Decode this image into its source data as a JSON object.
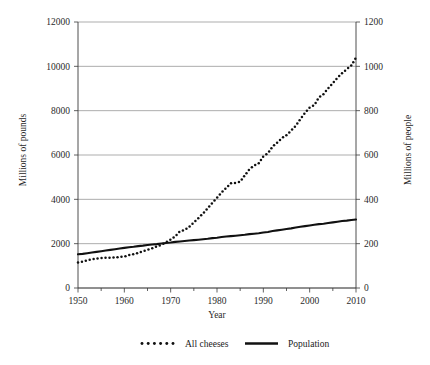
{
  "figure": {
    "background_color": "#ffffff",
    "ink_color": "#111111",
    "grid_color": "#8a8a8a"
  },
  "axes": {
    "left": {
      "title": "Millions of pounds",
      "ticks": [
        "0",
        "2000",
        "4000",
        "6000",
        "8000",
        "10000",
        "12000"
      ]
    },
    "right": {
      "title": "Millions of people",
      "ticks": [
        "0",
        "200",
        "400",
        "600",
        "800",
        "1000",
        "1200"
      ]
    },
    "bottom": {
      "title": "Year",
      "ticks": [
        "1950",
        "1960",
        "1970",
        "1980",
        "1990",
        "2000",
        "2010"
      ]
    }
  },
  "legend": {
    "items": [
      {
        "label": "All cheeses",
        "marker": "dotted"
      },
      {
        "label": "Population",
        "marker": "solid"
      }
    ]
  },
  "chart_data": {
    "type": "line",
    "title": "",
    "subtitle": "",
    "xlabel": "Year",
    "ylabel": "Millions of pounds",
    "y2label": "Millions of people",
    "xlim": [
      1950,
      2010
    ],
    "ylim": [
      0,
      12000
    ],
    "y2lim": [
      0,
      1200
    ],
    "xticks": [
      1950,
      1960,
      1970,
      1980,
      1990,
      2000,
      2010
    ],
    "xminor_ticks": [
      1955,
      1965,
      1975,
      1985,
      1995,
      2005
    ],
    "yticks": [
      0,
      2000,
      4000,
      6000,
      8000,
      10000,
      12000
    ],
    "y2ticks": [
      0,
      200,
      400,
      600,
      800,
      1000,
      1200
    ],
    "grid": "horizontal",
    "legend_position": "bottom-center",
    "x": [
      1950,
      1951,
      1952,
      1953,
      1954,
      1955,
      1956,
      1957,
      1958,
      1959,
      1960,
      1961,
      1962,
      1963,
      1964,
      1965,
      1966,
      1967,
      1968,
      1969,
      1970,
      1971,
      1972,
      1973,
      1974,
      1975,
      1976,
      1977,
      1978,
      1979,
      1980,
      1981,
      1982,
      1983,
      1984,
      1985,
      1986,
      1987,
      1988,
      1989,
      1990,
      1991,
      1992,
      1993,
      1994,
      1995,
      1996,
      1997,
      1998,
      1999,
      2000,
      2001,
      2002,
      2003,
      2004,
      2005,
      2006,
      2007,
      2008,
      2009,
      2010
    ],
    "series": [
      {
        "name": "All cheeses",
        "axis": "left",
        "style": "dotted",
        "units": "Millions of pounds",
        "values": [
          1150,
          1190,
          1250,
          1290,
          1330,
          1350,
          1370,
          1370,
          1380,
          1400,
          1420,
          1480,
          1530,
          1580,
          1660,
          1720,
          1790,
          1870,
          1950,
          2060,
          2180,
          2330,
          2560,
          2610,
          2760,
          2960,
          3160,
          3360,
          3600,
          3840,
          4070,
          4310,
          4520,
          4730,
          4740,
          4790,
          5080,
          5360,
          5520,
          5620,
          5940,
          6080,
          6380,
          6560,
          6760,
          6900,
          7100,
          7320,
          7620,
          7900,
          8140,
          8250,
          8600,
          8750,
          9010,
          9240,
          9480,
          9690,
          9870,
          10040,
          10400
        ]
      },
      {
        "name": "Population",
        "axis": "right",
        "style": "solid",
        "units": "Millions of people",
        "values": [
          152,
          154,
          157,
          160,
          163,
          166,
          169,
          172,
          175,
          178,
          181,
          184,
          186,
          189,
          191,
          194,
          196,
          198,
          201,
          203,
          205,
          208,
          210,
          212,
          214,
          216,
          218,
          220,
          222,
          225,
          227,
          230,
          232,
          234,
          236,
          238,
          240,
          243,
          245,
          247,
          250,
          253,
          257,
          260,
          263,
          266,
          269,
          273,
          276,
          279,
          282,
          285,
          288,
          290,
          293,
          296,
          299,
          302,
          304,
          307,
          309
        ]
      }
    ]
  }
}
